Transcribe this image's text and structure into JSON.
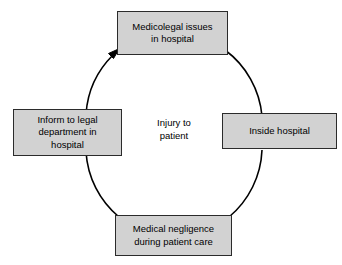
{
  "diagram": {
    "type": "cyclic-process",
    "background_color": "#ffffff",
    "node_fill_color": "#d2d2d2",
    "node_border_color": "#2b2b2b",
    "arc_color": "#000000",
    "center": {
      "label": "Injury to\npatient"
    },
    "nodes": [
      {
        "id": "node-top",
        "position": "top",
        "label": "Medicolegal issues\nin hospital"
      },
      {
        "id": "node-right",
        "position": "right",
        "label": "Inside hospital"
      },
      {
        "id": "node-bottom",
        "position": "bottom",
        "label": "Medical negligence\nduring patient care"
      },
      {
        "id": "node-left",
        "position": "left",
        "label": "Inform to legal\ndepartment in\nhospital"
      }
    ],
    "flow": {
      "direction": "clockwise",
      "arrowhead_at": "node-top",
      "arrowhead_name": "arrowhead-to-medicolegal-issues"
    }
  }
}
